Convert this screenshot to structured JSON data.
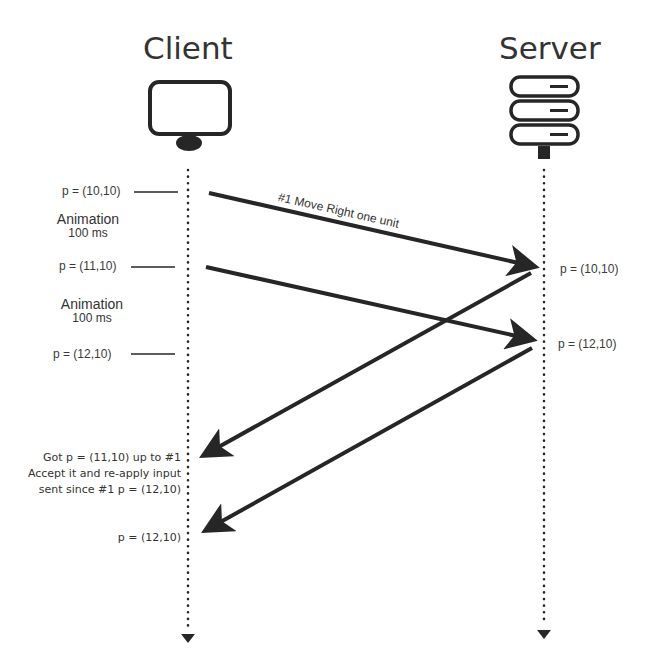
{
  "participants": {
    "client": {
      "title": "Client",
      "icon": "monitor-icon"
    },
    "server": {
      "title": "Server",
      "icon": "server-rack-icon"
    }
  },
  "client_states": [
    {
      "label": "p = (10,10)"
    },
    {
      "label": "p = (11,10)"
    },
    {
      "label": "p = (12,10)"
    }
  ],
  "animations": [
    {
      "title": "Animation",
      "duration": "100 ms"
    },
    {
      "title": "Animation",
      "duration": "100 ms"
    }
  ],
  "server_states": [
    {
      "label": "p = (10,10)"
    },
    {
      "label": "p = (12,10)"
    }
  ],
  "messages": [
    {
      "label": "#1 Move Right one unit",
      "from": "client",
      "to": "server"
    }
  ],
  "client_notes": {
    "reconcile_line1": "Got p = (11,10) up to #1",
    "reconcile_line2": "Accept it and re-apply input",
    "reconcile_line3": "sent since #1  p = (12,10)",
    "final_state": "p = (12,10)"
  },
  "colors": {
    "line": "#262626",
    "text": "#333333",
    "background": "#ffffff"
  }
}
